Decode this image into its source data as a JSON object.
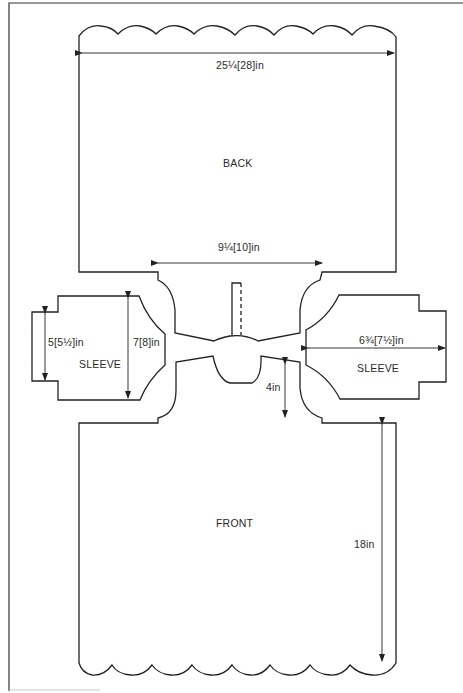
{
  "diagram": {
    "type": "garment-schematic",
    "pieces": [
      {
        "id": "back",
        "label": "BACK"
      },
      {
        "id": "front",
        "label": "FRONT"
      },
      {
        "id": "sleeve-left",
        "label": "SLEEVE"
      },
      {
        "id": "sleeve-right",
        "label": "SLEEVE"
      }
    ],
    "measurements": {
      "back_width": "25¼[28]in",
      "neck_width": "9¼[10]in",
      "sleeve_cuff": "5[5½]in",
      "sleeve_top": "7[8]in",
      "sleeve_length": "6¾[7½]in",
      "neck_depth": "4in",
      "front_length": "18in"
    },
    "colors": {
      "line": "#222222",
      "background": "#ffffff"
    }
  }
}
